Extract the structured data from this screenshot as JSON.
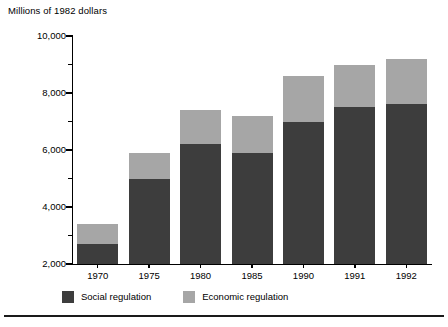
{
  "chart_data": {
    "type": "bar",
    "subtype": "stacked-vertical",
    "title": "Millions of 1982 dollars",
    "xlabel": "",
    "ylabel": "Millions of 1982 dollars",
    "categories": [
      "1970",
      "1975",
      "1980",
      "1985",
      "1990",
      "1991",
      "1992"
    ],
    "series": [
      {
        "name": "Social regulation",
        "color": "#3d3d3d",
        "values": [
          2700,
          5000,
          6200,
          5900,
          7000,
          7500,
          7600
        ]
      },
      {
        "name": "Economic regulation",
        "color": "#a6a6a6",
        "values": [
          700,
          900,
          1200,
          1300,
          1600,
          1500,
          1600
        ]
      }
    ],
    "totals": [
      3400,
      5900,
      7400,
      7200,
      8600,
      9000,
      9200
    ],
    "ylim": [
      2000,
      10000
    ],
    "y_ticks_major": [
      2000,
      4000,
      6000,
      8000,
      10000
    ],
    "y_tick_labels": [
      "2,000",
      "4,000",
      "6,000",
      "8,000",
      "10,000"
    ],
    "y_ticks_minor": [
      3000,
      5000,
      7000,
      9000
    ],
    "grid": false,
    "legend_position": "bottom-left",
    "legend_entries": [
      "Social regulation",
      "Economic regulation"
    ]
  },
  "axis": {
    "title": "Millions of 1982 dollars",
    "y_labels": [
      "10,000",
      "8,000",
      "6,000",
      "4,000",
      "2,000"
    ],
    "x_labels": [
      "1970",
      "1975",
      "1980",
      "1985",
      "1990",
      "1991",
      "1992"
    ]
  },
  "legend": {
    "social_label": "Social regulation",
    "economic_label": "Economic regulation",
    "social_color": "#3d3d3d",
    "economic_color": "#a6a6a6"
  }
}
